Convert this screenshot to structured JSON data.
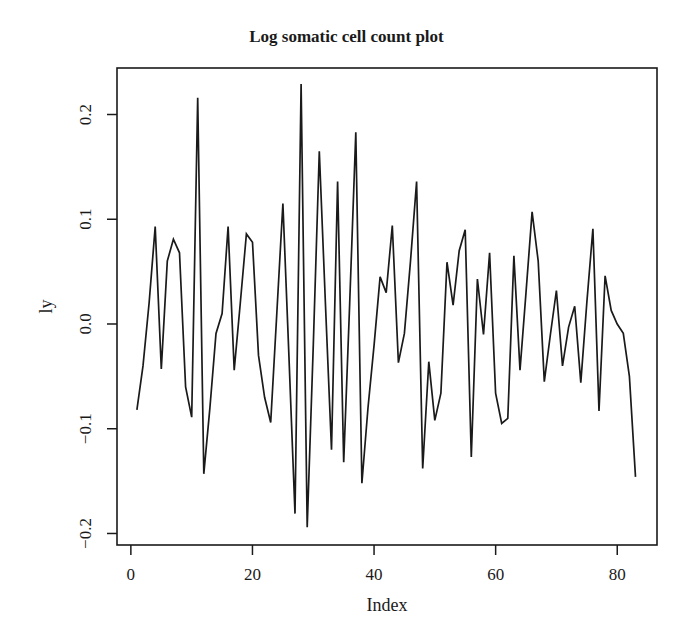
{
  "chart_data": {
    "type": "line",
    "title": "Log somatic cell count plot",
    "xlabel": "Index",
    "ylabel": "ly",
    "xlim": [
      -2.28,
      86.54
    ],
    "ylim": [
      -0.211,
      0.2444
    ],
    "x_ticks": [
      0,
      20,
      40,
      60,
      80
    ],
    "x_tick_labels": [
      "0",
      "20",
      "40",
      "60",
      "80"
    ],
    "y_ticks": [
      -0.2,
      -0.1,
      0.0,
      0.1,
      0.2
    ],
    "y_tick_labels": [
      "-0.2",
      "-0.1",
      "0.0",
      "0.1",
      "0.2"
    ],
    "grid": false,
    "legend": null,
    "line_color": "#1a1a1a",
    "series": [
      {
        "name": "ly",
        "x": [
          1,
          2,
          3,
          4,
          5,
          6,
          7,
          8,
          9,
          10,
          11,
          12,
          13,
          14,
          15,
          16,
          17,
          18,
          19,
          20,
          21,
          22,
          23,
          24,
          25,
          26,
          27,
          28,
          29,
          30,
          31,
          32,
          33,
          34,
          35,
          36,
          37,
          38,
          39,
          40,
          41,
          42,
          43,
          44,
          45,
          46,
          47,
          48,
          49,
          50,
          51,
          52,
          53,
          54,
          55,
          56,
          57,
          58,
          59,
          60,
          61,
          62,
          63,
          64,
          65,
          66,
          67,
          68,
          69,
          70,
          71,
          72,
          73,
          74,
          75,
          76,
          77,
          78,
          79,
          80,
          81,
          82,
          83
        ],
        "values": [
          -0.082,
          -0.04,
          0.02,
          0.093,
          -0.043,
          0.06,
          0.081,
          0.068,
          -0.06,
          -0.089,
          0.216,
          -0.143,
          -0.08,
          -0.009,
          0.01,
          0.093,
          -0.044,
          0.02,
          0.086,
          0.078,
          -0.03,
          -0.07,
          -0.094,
          0.01,
          0.115,
          -0.03,
          -0.181,
          0.229,
          -0.194,
          -0.02,
          0.165,
          0.02,
          -0.12,
          0.136,
          -0.132,
          0.02,
          0.183,
          -0.152,
          -0.08,
          -0.02,
          0.045,
          0.03,
          0.094,
          -0.037,
          -0.009,
          0.06,
          0.136,
          -0.138,
          -0.036,
          -0.092,
          -0.066,
          0.059,
          0.018,
          0.07,
          0.09,
          -0.127,
          0.043,
          -0.01,
          0.068,
          -0.066,
          -0.095,
          -0.09,
          0.065,
          -0.044,
          0.03,
          0.107,
          0.06,
          -0.055,
          -0.01,
          0.032,
          -0.04,
          -0.003,
          0.017,
          -0.056,
          0.02,
          0.091,
          -0.083,
          0.046,
          0.013,
          0.0,
          -0.009,
          -0.05,
          -0.146
        ]
      }
    ]
  },
  "layout": {
    "plot_left": 117,
    "plot_right": 657,
    "plot_top": 68,
    "plot_bottom": 545
  }
}
